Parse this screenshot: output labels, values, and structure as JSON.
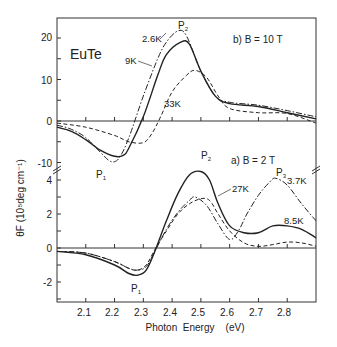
{
  "chart_data": {
    "type": "line",
    "title": "EuTe",
    "xlabel": "Photon Energy (eV)",
    "ylabel": "θF (10^5 deg cm^-1)",
    "xlim": [
      2.0,
      2.9
    ],
    "x_ticks": [
      "2.1",
      "2.2",
      "2.3",
      "2.4",
      "2.5",
      "2.6",
      "2.7",
      "2.8"
    ],
    "panels": [
      {
        "id": "b",
        "label": "b) B = 10 T",
        "ylim": [
          -12,
          24
        ],
        "y_ticks": [
          "20",
          "10",
          "0",
          "-10"
        ],
        "peak_labels": [
          {
            "text": "P",
            "sub": "1",
            "x": 2.19,
            "y": -10
          },
          {
            "text": "P",
            "sub": "2",
            "x": 2.42,
            "y": 21.5
          }
        ],
        "series": [
          {
            "name": "2.6K",
            "style": "dash-dot",
            "x": [
              2.0,
              2.05,
              2.1,
              2.15,
              2.18,
              2.2,
              2.22,
              2.25,
              2.3,
              2.35,
              2.38,
              2.42,
              2.45,
              2.5,
              2.55,
              2.6,
              2.7,
              2.8,
              2.9
            ],
            "y": [
              -1,
              -2,
              -4,
              -7.5,
              -9.5,
              -9.8,
              -8.5,
              -4,
              6,
              15,
              19,
              21.7,
              20.5,
              12,
              6,
              4.5,
              3.8,
              2.5,
              1
            ]
          },
          {
            "name": "9K",
            "style": "solid",
            "x": [
              2.0,
              2.05,
              2.1,
              2.15,
              2.2,
              2.23,
              2.25,
              2.3,
              2.35,
              2.38,
              2.43,
              2.46,
              2.5,
              2.55,
              2.6,
              2.7,
              2.8,
              2.9
            ],
            "y": [
              -1.5,
              -2.5,
              -4.5,
              -7,
              -8.5,
              -8.3,
              -6.5,
              1,
              11,
              16,
              19,
              18.5,
              12,
              6,
              4.2,
              3.5,
              2,
              0.5
            ]
          },
          {
            "name": "33K",
            "style": "dashed",
            "x": [
              2.0,
              2.1,
              2.2,
              2.25,
              2.3,
              2.33,
              2.36,
              2.4,
              2.45,
              2.48,
              2.52,
              2.56,
              2.6,
              2.7,
              2.8,
              2.9
            ],
            "y": [
              -0.5,
              -1.5,
              -3.5,
              -5,
              -5.2,
              -3,
              1,
              7,
              11,
              12.2,
              10.5,
              6,
              3,
              2,
              1.8,
              -0.5
            ]
          }
        ],
        "annotations": [
          "2.6K",
          "9K",
          "33K"
        ]
      },
      {
        "id": "a",
        "label": "a) B = 2 T",
        "ylim": [
          -3,
          4
        ],
        "y_ticks": [
          "4",
          "2",
          "0",
          "-2"
        ],
        "peak_labels": [
          {
            "text": "P",
            "sub": "1",
            "x": 2.28,
            "y": -1.6
          },
          {
            "text": "P",
            "sub": "2",
            "x": 2.5,
            "y": 4.5
          },
          {
            "text": "P",
            "sub": "3",
            "x": 2.76,
            "y": 4.1
          }
        ],
        "series": [
          {
            "name": "3.7K",
            "style": "dash-dot",
            "x": [
              2.0,
              2.1,
              2.2,
              2.25,
              2.28,
              2.31,
              2.34,
              2.38,
              2.42,
              2.46,
              2.48,
              2.52,
              2.56,
              2.6,
              2.63,
              2.66,
              2.7,
              2.74,
              2.76,
              2.8,
              2.85,
              2.9
            ],
            "y": [
              -0.2,
              -0.3,
              -0.8,
              -1.2,
              -1.3,
              -1.1,
              -0.2,
              1.1,
              2.1,
              2.8,
              3.0,
              2.5,
              1.4,
              0.5,
              1.0,
              2.0,
              3.1,
              3.9,
              4.1,
              3.7,
              2.6,
              1.6
            ]
          },
          {
            "name": "8.5K",
            "style": "solid",
            "x": [
              2.0,
              2.1,
              2.2,
              2.25,
              2.28,
              2.31,
              2.34,
              2.38,
              2.42,
              2.46,
              2.5,
              2.53,
              2.56,
              2.6,
              2.65,
              2.7,
              2.75,
              2.8,
              2.85,
              2.9
            ],
            "y": [
              -0.2,
              -0.4,
              -1.0,
              -1.5,
              -1.6,
              -1.3,
              -0.2,
              1.6,
              3.2,
              4.3,
              4.5,
              4.0,
              2.6,
              1.3,
              0.9,
              0.9,
              1.3,
              1.3,
              1.1,
              0.6
            ]
          },
          {
            "name": "27K",
            "style": "dashed",
            "x": [
              2.0,
              2.1,
              2.2,
              2.25,
              2.28,
              2.31,
              2.34,
              2.38,
              2.42,
              2.46,
              2.5,
              2.53,
              2.56,
              2.6,
              2.65,
              2.7,
              2.75,
              2.8,
              2.85,
              2.9
            ],
            "y": [
              -0.2,
              -0.3,
              -0.8,
              -1.2,
              -1.3,
              -1.0,
              -0.1,
              1.0,
              2.0,
              2.6,
              2.9,
              2.8,
              2.0,
              1.0,
              0.3,
              0.1,
              0.2,
              0.35,
              0.3,
              0.1
            ]
          }
        ],
        "annotations": [
          "3.7K",
          "8.5K",
          "27K"
        ]
      }
    ]
  },
  "labels": {
    "title": "EuTe",
    "panel_b": "b) B = 10 T",
    "panel_a": "a) B = 2 T",
    "xlabel": "Photon  Energy    (eV)",
    "ylabel": "θF (10⁵deg cm⁻¹)",
    "curve_labels": {
      "b_26K": "2.6K",
      "b_9K": "9K",
      "b_33K": "33K",
      "a_27K": "27K",
      "a_37K": "3.7K",
      "a_85K": "8.5K"
    },
    "peaks": {
      "P": "P",
      "s1": "1",
      "s2": "2",
      "s3": "3"
    }
  }
}
